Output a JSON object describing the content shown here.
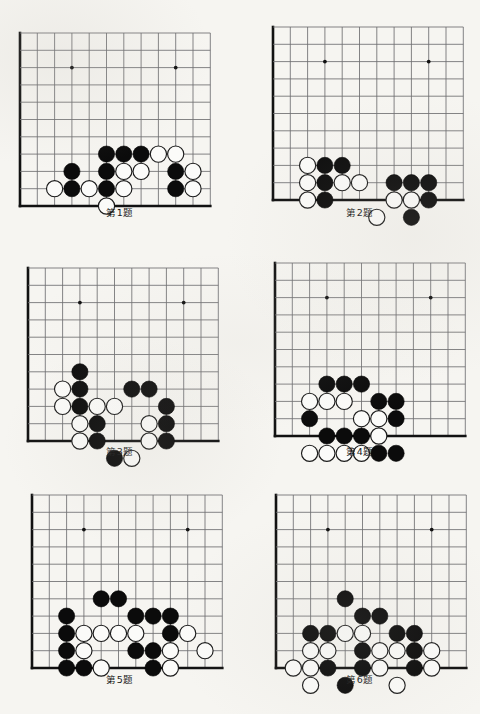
{
  "page": {
    "kind": "go-problem-worksheet",
    "background_color": "#f6f5f1",
    "ink_color": "#111111",
    "grid_color": "#6e6e70",
    "problem_count": 6
  },
  "board_spec": {
    "cols": 11,
    "rows": 10,
    "spacing_px": 17.3,
    "stone_radius_px": 8.1,
    "corner": "bottom-left",
    "edges": [
      "left",
      "bottom"
    ],
    "star_points": [
      [
        3,
        2
      ],
      [
        9,
        2
      ],
      [
        3,
        8
      ]
    ]
  },
  "problems": [
    {
      "id": 1,
      "caption": "第1题",
      "black": [
        [
          3,
          8
        ],
        [
          3,
          9
        ],
        [
          5,
          7
        ],
        [
          5,
          8
        ],
        [
          5,
          9
        ],
        [
          6,
          7
        ],
        [
          7,
          7
        ],
        [
          9,
          8
        ],
        [
          9,
          9
        ]
      ],
      "white": [
        [
          2,
          9
        ],
        [
          4,
          9
        ],
        [
          6,
          8
        ],
        [
          7,
          8
        ],
        [
          8,
          7
        ],
        [
          9,
          7
        ],
        [
          6,
          9
        ],
        [
          10,
          8
        ],
        [
          10,
          9
        ],
        [
          5,
          10
        ]
      ]
    },
    {
      "id": 2,
      "caption": "第2题",
      "black": [
        [
          3,
          8
        ],
        [
          4,
          8
        ],
        [
          3,
          9
        ],
        [
          3,
          10
        ],
        [
          7,
          9
        ],
        [
          8,
          9
        ],
        [
          9,
          9
        ],
        [
          9,
          10
        ],
        [
          8,
          11
        ]
      ],
      "white": [
        [
          2,
          8
        ],
        [
          2,
          9
        ],
        [
          2,
          10
        ],
        [
          4,
          9
        ],
        [
          5,
          9
        ],
        [
          7,
          10
        ],
        [
          8,
          10
        ],
        [
          6,
          11
        ]
      ]
    },
    {
      "id": 3,
      "caption": "第3题",
      "black": [
        [
          3,
          6
        ],
        [
          3,
          7
        ],
        [
          3,
          8
        ],
        [
          6,
          7
        ],
        [
          7,
          7
        ],
        [
          8,
          8
        ],
        [
          4,
          9
        ],
        [
          4,
          10
        ],
        [
          8,
          9
        ],
        [
          8,
          10
        ],
        [
          5,
          11
        ]
      ],
      "white": [
        [
          2,
          7
        ],
        [
          2,
          8
        ],
        [
          4,
          8
        ],
        [
          5,
          8
        ],
        [
          3,
          9
        ],
        [
          3,
          10
        ],
        [
          7,
          9
        ],
        [
          7,
          10
        ],
        [
          6,
          11
        ]
      ]
    },
    {
      "id": 4,
      "caption": "第4题",
      "black": [
        [
          3,
          7
        ],
        [
          4,
          7
        ],
        [
          5,
          7
        ],
        [
          6,
          8
        ],
        [
          7,
          8
        ],
        [
          7,
          9
        ],
        [
          2,
          9
        ],
        [
          3,
          10
        ],
        [
          4,
          10
        ],
        [
          5,
          10
        ],
        [
          6,
          11
        ],
        [
          7,
          11
        ]
      ],
      "white": [
        [
          2,
          8
        ],
        [
          3,
          8
        ],
        [
          4,
          8
        ],
        [
          5,
          9
        ],
        [
          6,
          9
        ],
        [
          6,
          10
        ],
        [
          2,
          11
        ],
        [
          3,
          11
        ],
        [
          4,
          11
        ],
        [
          5,
          11
        ]
      ]
    },
    {
      "id": 5,
      "caption": "第5题",
      "black": [
        [
          4,
          6
        ],
        [
          5,
          6
        ],
        [
          2,
          7
        ],
        [
          6,
          7
        ],
        [
          7,
          7
        ],
        [
          8,
          7
        ],
        [
          2,
          8
        ],
        [
          8,
          8
        ],
        [
          2,
          9
        ],
        [
          6,
          9
        ],
        [
          7,
          9
        ],
        [
          2,
          10
        ],
        [
          3,
          10
        ],
        [
          7,
          10
        ]
      ],
      "white": [
        [
          3,
          8
        ],
        [
          4,
          8
        ],
        [
          5,
          8
        ],
        [
          6,
          8
        ],
        [
          9,
          8
        ],
        [
          3,
          9
        ],
        [
          10,
          9
        ],
        [
          8,
          9
        ],
        [
          4,
          10
        ],
        [
          8,
          10
        ]
      ]
    },
    {
      "id": 6,
      "caption": "第6题",
      "black": [
        [
          4,
          6
        ],
        [
          5,
          7
        ],
        [
          6,
          7
        ],
        [
          2,
          8
        ],
        [
          3,
          8
        ],
        [
          7,
          8
        ],
        [
          8,
          8
        ],
        [
          5,
          9
        ],
        [
          8,
          9
        ],
        [
          3,
          10
        ],
        [
          5,
          10
        ],
        [
          8,
          10
        ],
        [
          4,
          11
        ]
      ],
      "white": [
        [
          4,
          8
        ],
        [
          5,
          8
        ],
        [
          2,
          9
        ],
        [
          3,
          9
        ],
        [
          6,
          9
        ],
        [
          7,
          9
        ],
        [
          9,
          9
        ],
        [
          1,
          10
        ],
        [
          2,
          10
        ],
        [
          6,
          10
        ],
        [
          9,
          10
        ],
        [
          2,
          11
        ],
        [
          7,
          11
        ]
      ]
    }
  ]
}
